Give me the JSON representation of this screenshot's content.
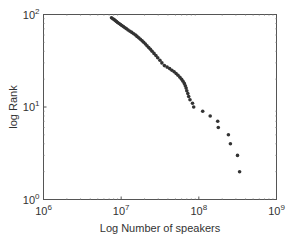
{
  "chart_data": {
    "type": "scatter",
    "title": "",
    "xlabel": "Log Number of speakers",
    "ylabel": "log Rank",
    "xscale": "log",
    "yscale": "log",
    "xlim": [
      1000000,
      1000000000
    ],
    "ylim": [
      1,
      100
    ],
    "grid": false,
    "legend": null,
    "x_ticks": [
      {
        "value": 1000000,
        "base": "10",
        "exp": "6"
      },
      {
        "value": 10000000,
        "base": "10",
        "exp": "7"
      },
      {
        "value": 100000000,
        "base": "10",
        "exp": "8"
      },
      {
        "value": 1000000000,
        "base": "10",
        "exp": "9"
      }
    ],
    "y_ticks": [
      {
        "value": 1,
        "base": "10",
        "exp": "0"
      },
      {
        "value": 10,
        "base": "10",
        "exp": "1"
      },
      {
        "value": 100,
        "base": "10",
        "exp": "2"
      }
    ],
    "marker_color": "#333333",
    "points": [
      {
        "x": 7500000,
        "y": 92
      },
      {
        "x": 7800000,
        "y": 90
      },
      {
        "x": 8100000,
        "y": 88
      },
      {
        "x": 8400000,
        "y": 86
      },
      {
        "x": 8700000,
        "y": 84
      },
      {
        "x": 9000000,
        "y": 82
      },
      {
        "x": 9400000,
        "y": 80
      },
      {
        "x": 9800000,
        "y": 78
      },
      {
        "x": 10200000,
        "y": 76
      },
      {
        "x": 10700000,
        "y": 74
      },
      {
        "x": 11200000,
        "y": 72
      },
      {
        "x": 11700000,
        "y": 70
      },
      {
        "x": 12300000,
        "y": 68
      },
      {
        "x": 13000000,
        "y": 66
      },
      {
        "x": 13700000,
        "y": 64
      },
      {
        "x": 14500000,
        "y": 62
      },
      {
        "x": 15300000,
        "y": 60
      },
      {
        "x": 16000000,
        "y": 58
      },
      {
        "x": 16800000,
        "y": 56
      },
      {
        "x": 17700000,
        "y": 54
      },
      {
        "x": 18600000,
        "y": 52
      },
      {
        "x": 19500000,
        "y": 50
      },
      {
        "x": 20500000,
        "y": 48
      },
      {
        "x": 21500000,
        "y": 46
      },
      {
        "x": 22600000,
        "y": 44
      },
      {
        "x": 23800000,
        "y": 42
      },
      {
        "x": 25000000,
        "y": 40
      },
      {
        "x": 26500000,
        "y": 38
      },
      {
        "x": 28000000,
        "y": 36
      },
      {
        "x": 29500000,
        "y": 34
      },
      {
        "x": 31500000,
        "y": 32
      },
      {
        "x": 33500000,
        "y": 30
      },
      {
        "x": 36000000,
        "y": 28
      },
      {
        "x": 39000000,
        "y": 27
      },
      {
        "x": 42000000,
        "y": 26
      },
      {
        "x": 45000000,
        "y": 25
      },
      {
        "x": 48000000,
        "y": 24
      },
      {
        "x": 51000000,
        "y": 23
      },
      {
        "x": 54000000,
        "y": 22
      },
      {
        "x": 57000000,
        "y": 21
      },
      {
        "x": 60000000,
        "y": 20
      },
      {
        "x": 62500000,
        "y": 19
      },
      {
        "x": 65000000,
        "y": 18
      },
      {
        "x": 67000000,
        "y": 17
      },
      {
        "x": 68500000,
        "y": 16
      },
      {
        "x": 70000000,
        "y": 15
      },
      {
        "x": 72000000,
        "y": 14
      },
      {
        "x": 74000000,
        "y": 13
      },
      {
        "x": 77000000,
        "y": 12
      },
      {
        "x": 83000000,
        "y": 11
      },
      {
        "x": 86000000,
        "y": 10
      },
      {
        "x": 112000000,
        "y": 9
      },
      {
        "x": 140000000,
        "y": 8
      },
      {
        "x": 175000000,
        "y": 7
      },
      {
        "x": 178000000,
        "y": 6
      },
      {
        "x": 240000000,
        "y": 5
      },
      {
        "x": 255000000,
        "y": 4
      },
      {
        "x": 315000000,
        "y": 3
      },
      {
        "x": 335000000,
        "y": 2
      }
    ]
  }
}
